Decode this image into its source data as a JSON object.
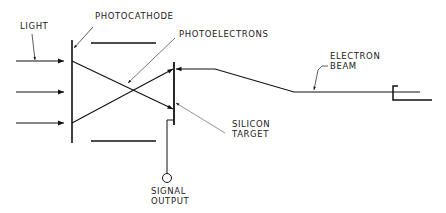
{
  "diagram": {
    "type": "schematic",
    "colors": {
      "line": "#111111",
      "leader": "#555555",
      "background": "#ffffff"
    },
    "labels": {
      "light": "LIGHT",
      "photocathode": "PHOTOCATHODE",
      "photoelectrons": "PHOTOELECTRONS",
      "electron_beam_1": "ELECTRON",
      "electron_beam_2": "BEAM",
      "silicon_target_1": "SILICON",
      "silicon_target_2": "TARGET",
      "signal_output_1": "SIGNAL",
      "signal_output_2": "OUTPUT"
    },
    "components": [
      {
        "name": "light-arrows",
        "count": 3
      },
      {
        "name": "photocathode"
      },
      {
        "name": "focus-plates",
        "count": 2
      },
      {
        "name": "photoelectron-paths",
        "count": 2
      },
      {
        "name": "silicon-target"
      },
      {
        "name": "electron-beam"
      },
      {
        "name": "electron-gun"
      },
      {
        "name": "signal-output-terminal"
      }
    ]
  }
}
